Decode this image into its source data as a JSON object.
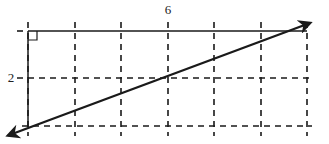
{
  "diagram": {
    "type": "grid-with-line",
    "labels": {
      "top": "6",
      "left": "2"
    },
    "grid": {
      "columns": 6,
      "rows": 2,
      "vertical_lines_x": [
        28,
        75,
        121,
        168,
        214,
        261,
        307
      ],
      "horizontal_lines_y": [
        31,
        78,
        126
      ],
      "style": "dashed"
    },
    "right_angle_marker": "top-left corner",
    "solid_segments": [
      "top horizontal",
      "left vertical"
    ],
    "arrow_line": {
      "from": [
        4,
        137
      ],
      "to": [
        313,
        22
      ],
      "arrowheads": "both ends"
    },
    "colors": {
      "ink": "#1a1a1a",
      "background": "#ffffff"
    }
  }
}
